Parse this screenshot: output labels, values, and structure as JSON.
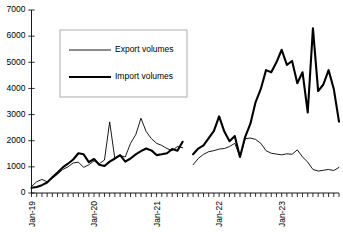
{
  "chart_data": {
    "type": "line",
    "title": "",
    "subtitle": "",
    "xlabel": "",
    "ylabel": "",
    "ylim": [
      0,
      7000
    ],
    "ytick_step": 1000,
    "ytick_labels": [
      "0",
      "1000",
      "2000",
      "3000",
      "4000",
      "5000",
      "6000",
      "7000"
    ],
    "ytick_values": [
      0,
      1000,
      2000,
      3000,
      4000,
      5000,
      6000,
      7000
    ],
    "grid": false,
    "legend_position": "upper-left",
    "x_axis": {
      "type": "monthly",
      "tick_frequency": "month",
      "labeled_ticks": [
        "Jan-19",
        "Jan-20",
        "Jan-21",
        "Jan-22",
        "Jan-23"
      ],
      "labeled_tick_indices": [
        0,
        12,
        24,
        36,
        48
      ],
      "tick_count": 60,
      "label_rotation": -90
    },
    "x": [
      "Jan-19",
      "Feb-19",
      "Mar-19",
      "Apr-19",
      "May-19",
      "Jun-19",
      "Jul-19",
      "Aug-19",
      "Sep-19",
      "Oct-19",
      "Nov-19",
      "Dec-19",
      "Jan-20",
      "Feb-20",
      "Mar-20",
      "Apr-20",
      "May-20",
      "Jun-20",
      "Jul-20",
      "Aug-20",
      "Sep-20",
      "Oct-20",
      "Nov-20",
      "Dec-20",
      "Jan-21",
      "Feb-21",
      "Mar-21",
      "Apr-21",
      "May-21",
      "Jun-21",
      "Jul-21",
      "Aug-21",
      "Sep-21",
      "Oct-21",
      "Nov-21",
      "Dec-21",
      "Jan-22",
      "Feb-22",
      "Mar-22",
      "Apr-22",
      "May-22",
      "Jun-22",
      "Jul-22",
      "Aug-22",
      "Sep-22",
      "Oct-22",
      "Nov-22",
      "Dec-22",
      "Jan-23",
      "Feb-23",
      "Mar-23",
      "Apr-23",
      "May-23",
      "Jun-23",
      "Jul-23",
      "Aug-23",
      "Sep-23",
      "Oct-23",
      "Nov-23",
      "Dec-23"
    ],
    "series": [
      {
        "name": "Export volumes",
        "line_style": "thin",
        "color": "#000000",
        "values": [
          250,
          430,
          520,
          430,
          560,
          720,
          900,
          1000,
          1150,
          1180,
          980,
          1080,
          1230,
          1120,
          1260,
          2720,
          1300,
          1430,
          1380,
          1900,
          2230,
          2860,
          2350,
          2080,
          1900,
          1820,
          1700,
          1620,
          1780,
          1730,
          null,
          1080,
          1320,
          1480,
          1580,
          1620,
          1680,
          1700,
          1780,
          1900,
          1380,
          2080,
          2100,
          2050,
          1900,
          1620,
          1520,
          1490,
          1460,
          1500,
          1480,
          1650,
          1380,
          1180,
          900,
          840,
          870,
          900,
          860,
          980
        ]
      },
      {
        "name": "Import volumes",
        "line_style": "thick",
        "color": "#000000",
        "values": [
          200,
          230,
          300,
          400,
          600,
          780,
          980,
          1120,
          1280,
          1520,
          1480,
          1180,
          1300,
          1080,
          1030,
          1200,
          1320,
          1450,
          1200,
          1320,
          1480,
          1600,
          1700,
          1630,
          1450,
          1480,
          1520,
          1680,
          1620,
          1960,
          null,
          1480,
          1700,
          1820,
          2100,
          2380,
          2930,
          2350,
          1980,
          2180,
          1380,
          2150,
          2650,
          3480,
          3980,
          4700,
          4620,
          5000,
          5480,
          4900,
          5050,
          4200,
          4620,
          3080,
          6300,
          3900,
          4150,
          4700,
          3980,
          2730
        ]
      }
    ]
  },
  "legend": {
    "items": [
      {
        "label": "Export volumes",
        "style": "thin"
      },
      {
        "label": "Import volumes",
        "style": "thick"
      }
    ]
  }
}
